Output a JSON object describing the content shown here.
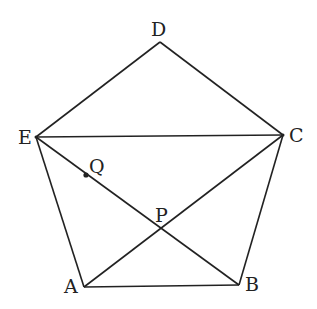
{
  "diagram": {
    "title": "",
    "points": {
      "A": {
        "label": "A",
        "x": 84,
        "y": 287
      },
      "B": {
        "label": "B",
        "x": 239,
        "y": 285
      },
      "C": {
        "label": "C",
        "x": 283,
        "y": 135
      },
      "D": {
        "label": "D",
        "x": 160,
        "y": 42
      },
      "E": {
        "label": "E",
        "x": 36,
        "y": 137
      },
      "P": {
        "label": "P",
        "x": 161,
        "y": 229
      },
      "Q": {
        "label": "Q",
        "x": 86,
        "y": 175
      }
    },
    "segments": [
      [
        "A",
        "B"
      ],
      [
        "B",
        "C"
      ],
      [
        "C",
        "D"
      ],
      [
        "D",
        "E"
      ],
      [
        "E",
        "A"
      ],
      [
        "E",
        "C"
      ],
      [
        "A",
        "C"
      ],
      [
        "E",
        "B"
      ]
    ],
    "stroke_color": "#222222"
  }
}
